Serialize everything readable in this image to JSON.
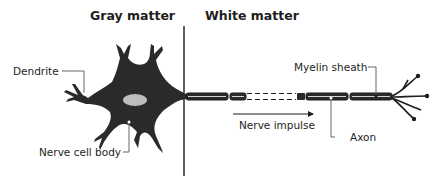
{
  "diagram": {
    "regions": {
      "gray_matter": "Gray matter",
      "white_matter": "White matter"
    },
    "labels": {
      "dendrite": "Dendrite",
      "nerve_cell_body": "Nerve cell body",
      "myelin_sheath": "Myelin sheath",
      "axon": "Axon",
      "nerve_impulse": "Nerve impulse"
    },
    "colors": {
      "neuron_fill": "#2a2a2a",
      "nucleus_fill": "#bdbdbd",
      "line": "#1e1e1e",
      "leader_line": "#555555",
      "background": "#ffffff"
    }
  }
}
